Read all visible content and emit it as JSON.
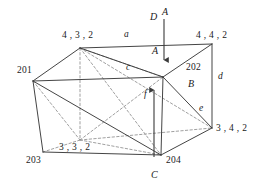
{
  "figure": {
    "type": "3d-wireframe-diagram",
    "title": "",
    "background_color": "#ffffff",
    "line_color": "#3a3a3a",
    "dashed_line_color": "#8a8a8a",
    "text_color": "#1a1a1a",
    "vertex_labels": [
      {
        "id": "v-432",
        "text": "4 , 3 , 2",
        "x": 62,
        "y": 31
      },
      {
        "id": "v-442",
        "text": "4 , 4 , 2",
        "x": 196,
        "y": 31
      },
      {
        "id": "v-201",
        "text": "201",
        "x": 17,
        "y": 66
      },
      {
        "id": "v-202",
        "text": "202",
        "x": 186,
        "y": 63
      },
      {
        "id": "v-342",
        "text": "3 , 4 , 2",
        "x": 216,
        "y": 124
      },
      {
        "id": "v-332",
        "text": "3 , 3 , 2",
        "x": 59,
        "y": 143
      },
      {
        "id": "v-203",
        "text": "203",
        "x": 26,
        "y": 156
      },
      {
        "id": "v-204",
        "text": "204",
        "x": 166,
        "y": 156
      }
    ],
    "edge_labels": [
      {
        "id": "edge-a",
        "text": "a",
        "x": 124,
        "y": 30
      },
      {
        "id": "edge-c",
        "text": "c",
        "x": 126,
        "y": 63
      },
      {
        "id": "edge-d",
        "text": "d",
        "x": 218,
        "y": 72
      },
      {
        "id": "edge-e",
        "text": "e",
        "x": 199,
        "y": 104
      },
      {
        "id": "edge-f",
        "text": "f",
        "x": 144,
        "y": 90
      },
      {
        "id": "face-B",
        "text": "B",
        "x": 188,
        "y": 79
      }
    ],
    "force_labels": [
      {
        "id": "force-D",
        "text": "D",
        "x": 150,
        "y": 12
      },
      {
        "id": "force-A-top",
        "text": "A",
        "x": 162,
        "y": 7
      },
      {
        "id": "force-A-mid",
        "text": "A",
        "x": 152,
        "y": 46
      },
      {
        "id": "force-C",
        "text": "C",
        "x": 151,
        "y": 170
      }
    ],
    "arrows": [
      {
        "id": "arrow-down-A",
        "x1": 164,
        "y1": 19,
        "x2": 164,
        "y2": 60,
        "direction": "down"
      },
      {
        "id": "arrow-up-f",
        "x1": 154,
        "y1": 157,
        "x2": 154,
        "y2": 90,
        "direction": "up"
      }
    ],
    "vertices": {
      "top_back_left": {
        "x": 80,
        "y": 48
      },
      "top_right_back": {
        "x": 212,
        "y": 44
      },
      "left_top": {
        "x": 33,
        "y": 81
      },
      "center_top": {
        "x": 163,
        "y": 77
      },
      "right_mid": {
        "x": 212,
        "y": 128
      },
      "bottom_hidden": {
        "x": 80,
        "y": 140
      },
      "bottom_left": {
        "x": 43,
        "y": 152
      },
      "bottom_center": {
        "x": 161,
        "y": 155
      }
    },
    "solid_edges": [
      [
        80,
        48,
        33,
        81
      ],
      [
        80,
        48,
        163,
        77
      ],
      [
        80,
        48,
        212,
        44
      ],
      [
        212,
        44,
        163,
        77
      ],
      [
        212,
        44,
        212,
        128
      ],
      [
        163,
        77,
        212,
        128
      ],
      [
        163,
        77,
        161,
        155
      ],
      [
        33,
        81,
        163,
        77
      ],
      [
        33,
        81,
        43,
        152
      ],
      [
        33,
        81,
        161,
        155
      ],
      [
        43,
        152,
        161,
        155
      ],
      [
        161,
        155,
        212,
        128
      ]
    ],
    "dashed_edges": [
      [
        80,
        48,
        80,
        140
      ],
      [
        80,
        48,
        161,
        155
      ],
      [
        80,
        48,
        212,
        128
      ],
      [
        80,
        48,
        163,
        77
      ],
      [
        33,
        81,
        80,
        140
      ],
      [
        80,
        140,
        43,
        152
      ],
      [
        80,
        140,
        161,
        155
      ],
      [
        80,
        140,
        212,
        128
      ],
      [
        80,
        140,
        163,
        77
      ]
    ]
  }
}
